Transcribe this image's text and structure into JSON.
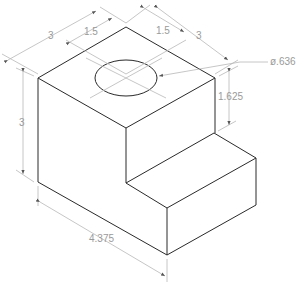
{
  "drawing": {
    "title": "Isometric block with step and through hole",
    "colors": {
      "edge": "#2a2a2a",
      "dimension": "#b8b8b8",
      "label": "#9a9a9a",
      "background": "#ffffff"
    },
    "dimensions": {
      "top_left_width": "3",
      "top_left_hole_offset": "1.5",
      "top_right_hole_offset": "1.5",
      "top_right_depth": "3",
      "hole_diameter": "ø.636",
      "step_height": "1.625",
      "overall_height": "3",
      "overall_length": "4.375"
    }
  }
}
